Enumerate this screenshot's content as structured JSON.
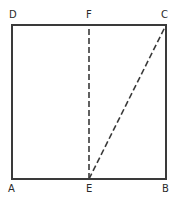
{
  "diagram": {
    "colors": {
      "line": "#3a3a3a",
      "dashed": "#3a3a3a",
      "label": "#2a2a2a"
    },
    "points": {
      "A": {
        "label": "A",
        "x": 12,
        "y": 179
      },
      "B": {
        "label": "B",
        "x": 166,
        "y": 179
      },
      "C": {
        "label": "C",
        "x": 166,
        "y": 25
      },
      "D": {
        "label": "D",
        "x": 12,
        "y": 25
      },
      "E": {
        "label": "E",
        "x": 89,
        "y": 179
      },
      "F": {
        "label": "F",
        "x": 89,
        "y": 25
      }
    },
    "solid_segments": [
      [
        "A",
        "B"
      ],
      [
        "B",
        "C"
      ],
      [
        "C",
        "D"
      ],
      [
        "D",
        "A"
      ]
    ],
    "dashed_segments": [
      [
        "E",
        "F"
      ],
      [
        "E",
        "C"
      ]
    ]
  }
}
